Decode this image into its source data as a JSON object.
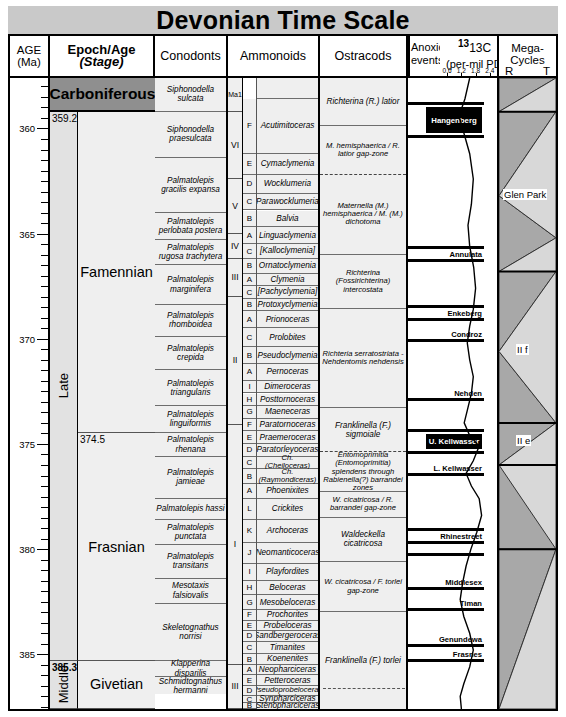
{
  "title": "Devonian Time Scale",
  "header": {
    "age": {
      "l1": "AGE",
      "l2": "(Ma)"
    },
    "epoch": {
      "l1": "Epoch/Age",
      "l2": "(Stage)"
    },
    "conodonts": {
      "l1": "Conodonts"
    },
    "ammonoids": {
      "l1": "Ammonoids"
    },
    "ostracods": {
      "l1": "Ostracods"
    },
    "anoxic": {
      "l1": "Anoxic",
      "l2": "events"
    },
    "d13c": {
      "l1": "13C",
      "l2": "(per-mil PDB)"
    },
    "mega": {
      "l1": "Mega-",
      "l2": "Cycles",
      "r": "R",
      "t": "T"
    }
  },
  "chart_data": {
    "type": "table",
    "title": "Devonian Time Scale",
    "ylabel": "AGE (Ma)",
    "ylim": [
      359.2,
      387.6
    ],
    "axis_ticks": [
      360,
      365,
      370,
      375,
      380,
      385
    ],
    "minor_tick_interval": 0.5,
    "d13c_axis": {
      "label": "13C (per-mil PDB)",
      "ticks": [
        0.6,
        1.2,
        1.8,
        2.4
      ],
      "range": [
        0.3,
        2.7
      ]
    },
    "epochs": [
      {
        "name": "Late",
        "top": 359.2,
        "base": 385.3
      },
      {
        "name": "Middle",
        "top": 385.3,
        "base": 387.6
      }
    ],
    "stages": [
      {
        "name": "Carboniferous",
        "top": 357.6,
        "base": 359.2,
        "shade": "dark"
      },
      {
        "name": "Famennian",
        "top": 359.2,
        "base": 374.5
      },
      {
        "name": "Frasnian",
        "top": 374.5,
        "base": 385.3
      },
      {
        "name": "Givetian",
        "top": 385.3,
        "base": 387.6
      }
    ],
    "boundary_labels": [
      "359.2",
      "374.5",
      "385.3"
    ],
    "conodont_zones": [
      "Siphonodella sulcata",
      "Siphonodella praesulcata",
      "Palmatolepis gracilis expansa",
      "Palmatolepis perlobata postera",
      "Palmatolepis rugosa trachytera",
      "Palmatolepis marginifera",
      "Palmatolepis rhomboidea",
      "Palmatolepis crepida",
      "Palmatolepis triangularis",
      "Palmatolepis linguiformis",
      "Palmatolepis rhenana",
      "Palmatolepis jamieae",
      "Palmatolepis hassi",
      "Palmatolepis punctata",
      "Palmatolepis transitans",
      "Mesotaxis falsiovalis",
      "Skeletognathus norrisi",
      "Klapperina disparilis",
      "Schmidtognathus hermanni"
    ],
    "ammonoid_stages": [
      "Ma1",
      "VI",
      "V",
      "IV",
      "III",
      "II",
      "I",
      "III"
    ],
    "ammonoid_zones": [
      {
        "letter": "F",
        "name": "Acutimitoceras"
      },
      {
        "letter": "E",
        "name": "Cymaclymenia"
      },
      {
        "letter": "D",
        "name": "Wocklumeria"
      },
      {
        "letter": "C",
        "name": "Parawocklumeria"
      },
      {
        "letter": "B",
        "name": "Balvia"
      },
      {
        "letter": "A",
        "name": "Linguaclymenia"
      },
      {
        "letter": "C",
        "name": "[Kalloclymenia]"
      },
      {
        "letter": "B",
        "name": "Ornatoclymenia"
      },
      {
        "letter": "A",
        "name": "Clymenia"
      },
      {
        "letter": "C",
        "name": "[Pachyclymenia]"
      },
      {
        "letter": "B",
        "name": "Protoxyclymenia"
      },
      {
        "letter": "A",
        "name": "Prionoceras"
      },
      {
        "letter": "C",
        "name": "Prolobites"
      },
      {
        "letter": "B",
        "name": "Pseudoclymenia"
      },
      {
        "letter": "A",
        "name": "Pernoceras"
      },
      {
        "letter": "I",
        "name": "Dimeroceras"
      },
      {
        "letter": "H",
        "name": "Posttornoceras"
      },
      {
        "letter": "G",
        "name": "Maeneceras"
      },
      {
        "letter": "F",
        "name": "Paratornoceras"
      },
      {
        "letter": "E",
        "name": "Praemeroceras"
      },
      {
        "letter": "D",
        "name": "Paratorleyoceras"
      },
      {
        "letter": "C",
        "name": "Ch. (Cheiloceras)"
      },
      {
        "letter": "B",
        "name": "Ch. (Raymondiceras)"
      },
      {
        "letter": "A",
        "name": "Phoenixites"
      },
      {
        "letter": "L",
        "name": "Crickites"
      },
      {
        "letter": "K",
        "name": "Archoceras"
      },
      {
        "letter": "J",
        "name": "Neomanticoceras"
      },
      {
        "letter": "I",
        "name": "Playfordites"
      },
      {
        "letter": "H",
        "name": "Beloceras"
      },
      {
        "letter": "G",
        "name": "Mesobeloceras"
      },
      {
        "letter": "F",
        "name": "Prochorites"
      },
      {
        "letter": "E",
        "name": "Probeloceras"
      },
      {
        "letter": "D",
        "name": "Sandbergeroceras"
      },
      {
        "letter": "C",
        "name": "Timanites"
      },
      {
        "letter": "B",
        "name": "Koenenites"
      },
      {
        "letter": "A",
        "name": "Neopharciceras"
      },
      {
        "letter": "E",
        "name": "Petteroceras"
      },
      {
        "letter": "D",
        "name": "Pseudoprobeloceras"
      },
      {
        "letter": "C",
        "name": "Synpharciceras"
      },
      {
        "letter": "B",
        "name": "Stenopharciceras"
      }
    ],
    "ostracod_zones": [
      "Richterina (R.) latior",
      "M. hemisphaerica / R. latior gap-zone",
      "Maternella (M.) hemisphaerica / M. (M.) dichotoma",
      "Richterina (Fossirichterina) intercostata",
      "Richteria serratostriata - Nehdentomis nehdensis",
      "Franklinella (F.) sigmoiale",
      "Entomoprimitia (Entomoprimitia) splendens through Rabienella(?) barrandei zones",
      "W. cicatricosa / R. barrandei gap-zone",
      "Waldeckella cicatricosa",
      "W. cicatricosa / F. torlei gap-zone",
      "Franklinella (F.) torlei"
    ],
    "anoxic_events": [
      {
        "name": "Hangenberg",
        "style": "box"
      },
      {
        "name": "Annulata",
        "style": "band"
      },
      {
        "name": "Enkeberg",
        "style": "band"
      },
      {
        "name": "Condroz",
        "style": "band"
      },
      {
        "name": "Nehden",
        "style": "band"
      },
      {
        "name": "U. Kellwasser",
        "style": "box"
      },
      {
        "name": "L. Kellwasser",
        "style": "band"
      },
      {
        "name": "Rhinestreet",
        "style": "band"
      },
      {
        "name": "Middlesex",
        "style": "band"
      },
      {
        "name": "Timan",
        "style": "band"
      },
      {
        "name": "Genundewa",
        "style": "band"
      },
      {
        "name": "Frasnes",
        "style": "band"
      }
    ],
    "megacycle_labels": [
      "Glen Park",
      "II f",
      "II e"
    ]
  }
}
